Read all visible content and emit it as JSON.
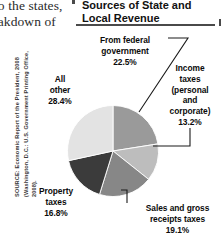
{
  "page_bleed": {
    "line1": "to the states,",
    "line2": "reakdown of"
  },
  "figure": {
    "title": "Sources of State and Local Revenue",
    "source": "SOURCE: Economic Report of the President, 2008 (Washington, D.C.: U.S. Government Printing Office, 2008)."
  },
  "chart_data": {
    "type": "pie",
    "title": "Sources of State and Local Revenue",
    "start_angle_deg": 0,
    "direction": "clockwise",
    "grid": false,
    "legend": "none (direct labels with leader lines)",
    "units": "percent",
    "total": 100.0,
    "categories": [
      "From federal government",
      "Income taxes (personal and corporate)",
      "Sales and gross receipts taxes",
      "Property taxes",
      "All other"
    ],
    "values": [
      22.5,
      13.2,
      19.1,
      16.8,
      28.4
    ],
    "colors": [
      "#9a9a9a",
      "#bdbdbd",
      "#878787",
      "#3b3b3b",
      "#e3e3e3"
    ],
    "slices": [
      {
        "name": "From federal government",
        "label_line1": "From federal",
        "label_line2": "government",
        "value_label": "22.5%",
        "value": 22.5,
        "color": "#9a9a9a"
      },
      {
        "name": "Income taxes (personal and corporate)",
        "label_line1": "Income",
        "label_line2": "taxes",
        "label_line3": "(personal",
        "label_line4": "and",
        "label_line5": "corporate)",
        "value_label": "13.2%",
        "value": 13.2,
        "color": "#bdbdbd"
      },
      {
        "name": "Sales and gross receipts taxes",
        "label_line1": "Sales and gross",
        "label_line2": "receipts taxes",
        "value_label": "19.1%",
        "value": 19.1,
        "color": "#878787"
      },
      {
        "name": "Property taxes",
        "label_line1": "Property",
        "label_line2": "taxes",
        "value_label": "16.8%",
        "value": 16.8,
        "color": "#3b3b3b"
      },
      {
        "name": "All other",
        "label_line1": "All",
        "label_line2": "other",
        "value_label": "28.4%",
        "value": 28.4,
        "color": "#e3e3e3"
      }
    ]
  }
}
